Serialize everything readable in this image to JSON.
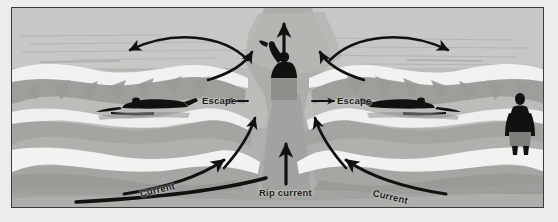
{
  "diagram": {
    "frame": {
      "border_color": "#3a3a3a",
      "background": "#ececeb"
    },
    "palette": {
      "sky_water_far": "#c6c6c4",
      "water_mid": "#b5b5b2",
      "water_dark": "#9e9e9b",
      "foam_white": "#f2f2f0",
      "beach_sand": "#a8a8a5",
      "beach_dark": "#949491",
      "silhouette": "#111111",
      "arrow": "#111111",
      "label_text": "#1b1b1b"
    },
    "labels": [
      {
        "id": "escape-left",
        "text": "Escape",
        "arrow": "left",
        "position": "left of rip channel"
      },
      {
        "id": "escape-right",
        "text": "Escape",
        "arrow": "right",
        "position": "right of rip channel"
      },
      {
        "id": "rip-current",
        "text": "Rip current",
        "arrow": "up",
        "position": "center bottom"
      },
      {
        "id": "current-left",
        "text": "Current",
        "arrow": "up-right",
        "rotation_deg": -13,
        "position": "lower left shoreline"
      },
      {
        "id": "current-right",
        "text": "Current",
        "arrow": "up-left",
        "rotation_deg": 13,
        "position": "lower right shoreline"
      }
    ],
    "figures": [
      {
        "id": "swimmer-left",
        "type": "swimmer-escaping",
        "facing": "left",
        "description": "swimmer swimming parallel to shore, away from rip"
      },
      {
        "id": "swimmer-right",
        "type": "swimmer-escaping",
        "facing": "right",
        "description": "swimmer swimming parallel to shore, away from rip"
      },
      {
        "id": "victim-center",
        "type": "person-waving",
        "facing": "front",
        "description": "person caught in rip current waving one arm for help"
      },
      {
        "id": "observer-right",
        "type": "person-standing",
        "facing": "front",
        "description": "person standing on the beach at the right edge"
      }
    ],
    "arrows": [
      {
        "id": "arc-top-left",
        "shape": "arc",
        "direction": "left",
        "meaning": "water spreading outward at the rip head"
      },
      {
        "id": "arc-top-right",
        "shape": "arc",
        "direction": "right",
        "meaning": "water spreading outward at the rip head"
      },
      {
        "id": "rip-head-up",
        "shape": "straight",
        "direction": "up",
        "meaning": "rip current flowing seaward past the breakers"
      },
      {
        "id": "feeder-left",
        "shape": "curve",
        "direction": "up-right",
        "meaning": "longshore feeder current entering the rip neck"
      },
      {
        "id": "feeder-right",
        "shape": "curve",
        "direction": "up-left",
        "meaning": "longshore feeder current entering the rip neck"
      },
      {
        "id": "rip-neck-up",
        "shape": "straight",
        "direction": "up",
        "meaning": "rip current neck"
      },
      {
        "id": "escape-arrow-left",
        "shape": "straight",
        "direction": "left",
        "meaning": "swim parallel to shore to escape"
      },
      {
        "id": "escape-arrow-right",
        "shape": "straight",
        "direction": "right",
        "meaning": "swim parallel to shore to escape"
      },
      {
        "id": "current-arrow-left",
        "shape": "curve",
        "direction": "up-right",
        "meaning": "longshore current along the beach"
      },
      {
        "id": "current-arrow-right",
        "shape": "curve",
        "direction": "up-left",
        "meaning": "longshore current along the beach"
      },
      {
        "id": "shore-sweep",
        "shape": "long-curve",
        "direction": "right",
        "meaning": "water moving along the shoreline"
      }
    ]
  }
}
